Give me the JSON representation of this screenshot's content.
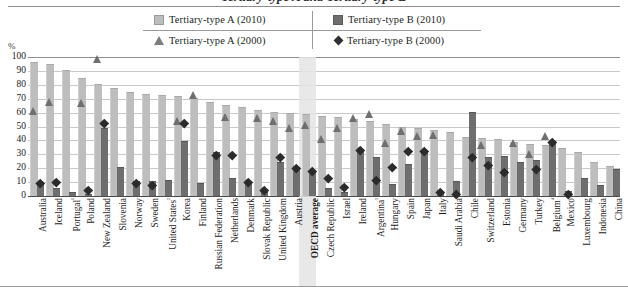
{
  "title": "Tertiary-type A and Tertiary-type B",
  "axis": {
    "unit_label": "%",
    "yticks": [
      0,
      10,
      20,
      30,
      40,
      50,
      60,
      70,
      80,
      90,
      100
    ]
  },
  "legend": {
    "items": [
      {
        "label": "Tertiary-type A (2010)",
        "marker": "square",
        "color": "#bdbdbd"
      },
      {
        "label": "Tertiary-type B (2010)",
        "marker": "square",
        "color": "#6e6e6e"
      },
      {
        "label": "Tertiary-type A (2000)",
        "marker": "triangle",
        "color": "#7d7d7d"
      },
      {
        "label": "Tertiary-type B (2000)",
        "marker": "diamond",
        "color": "#2f2f2f"
      }
    ]
  },
  "highlight": {
    "category": "OECD average"
  },
  "chart_data": {
    "type": "bar",
    "title": "Tertiary-type A and Tertiary-type B",
    "xlabel": "",
    "ylabel": "%",
    "ylim": [
      0,
      100
    ],
    "grid": true,
    "legend_position": "top",
    "categories": [
      "Australia",
      "Iceland",
      "Portugal¹",
      "Poland",
      "New Zealand",
      "Slovenia",
      "Norway",
      "Sweden",
      "United States²",
      "Korea",
      "Finland",
      "Russian Federation",
      "Netherlands",
      "Denmark",
      "Slovak Republic",
      "United Kingdom",
      "Austria",
      "OECD average",
      "Czech Republic",
      "Israel",
      "Ireland",
      "Argentina³",
      "Hungary",
      "Spain",
      "Japan",
      "Italy",
      "Saudi Arabia",
      "Chile",
      "Switzerland",
      "Estonia",
      "Germany",
      "Turkey",
      "Belgium⁴",
      "Mexico",
      "Luxembourg",
      "Indonesia",
      "China"
    ],
    "series": [
      {
        "name": "Tertiary-type A (2010)",
        "type": "bar",
        "color": "#bdbdbd",
        "values": [
          96,
          94,
          90,
          84,
          80,
          77,
          74,
          73,
          72,
          71,
          70,
          67,
          65,
          63,
          61,
          60,
          59,
          58,
          57,
          56,
          55,
          53,
          51,
          49,
          48,
          47,
          45,
          42,
          41,
          40,
          38,
          37,
          36,
          34,
          31,
          24,
          21
        ]
      },
      {
        "name": "Tertiary-type B (2010)",
        "type": "bar",
        "color": "#6e6e6e",
        "values": [
          9,
          5,
          2,
          1,
          48,
          20,
          10,
          10,
          11,
          39,
          9,
          31,
          12,
          10,
          2,
          24,
          20,
          17,
          5,
          2,
          32,
          27,
          8,
          22,
          30,
          2,
          10,
          60,
          27,
          28,
          24,
          25,
          39,
          3,
          12,
          7,
          19
        ]
      },
      {
        "name": "Tertiary-type A (2000)",
        "type": "scatter",
        "marker": "triangle",
        "color": "#6f6f6f",
        "values": [
          58,
          65,
          null,
          64,
          96,
          null,
          null,
          null,
          null,
          51,
          70,
          null,
          54,
          null,
          53,
          51,
          46,
          48,
          38,
          46,
          53,
          56,
          35,
          44,
          40,
          41,
          null,
          null,
          34,
          null,
          35,
          27,
          40,
          null,
          null,
          null,
          null
        ]
      },
      {
        "name": "Tertiary-type B (2000)",
        "type": "scatter",
        "marker": "diamond",
        "color": "#2b2b2b",
        "values": [
          9,
          10,
          null,
          4,
          52,
          null,
          9,
          8,
          null,
          52,
          null,
          29,
          29,
          10,
          4,
          28,
          20,
          18,
          13,
          6,
          33,
          11,
          21,
          32,
          32,
          3,
          1,
          28,
          22,
          17,
          null,
          19,
          39,
          1,
          null,
          null,
          null
        ]
      }
    ]
  }
}
